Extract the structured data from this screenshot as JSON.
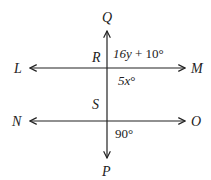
{
  "diagram": {
    "type": "geometry-lines",
    "colors": {
      "stroke": "#222222",
      "background": "#ffffff"
    },
    "lines": [
      {
        "name": "LM",
        "from": "L",
        "to": "M",
        "orientation": "horizontal",
        "arrows": "both"
      },
      {
        "name": "NO",
        "from": "N",
        "to": "O",
        "orientation": "horizontal",
        "arrows": "both"
      },
      {
        "name": "QP",
        "from": "Q",
        "to": "P",
        "orientation": "vertical",
        "arrows": "both"
      }
    ],
    "points": {
      "Q": "Q",
      "P": "P",
      "L": "L",
      "M": "M",
      "N": "N",
      "O": "O",
      "R": "R",
      "S": "S"
    },
    "angles": {
      "upper_right_R": {
        "var": "16y",
        "rest": " + 10°"
      },
      "lower_right_R": {
        "var": "5x",
        "rest": "°"
      },
      "lower_right_S": "90°"
    }
  }
}
